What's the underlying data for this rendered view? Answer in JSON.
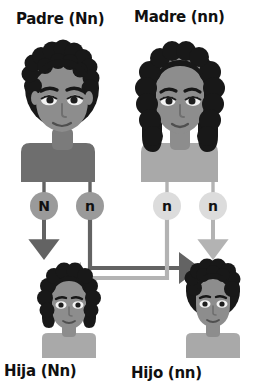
{
  "diagram": {
    "title_top_left": "Padre (Nn)",
    "title_top_right": "Madre (nn)",
    "title_bottom_left": "Hija (Nn)",
    "title_bottom_right": "Hijo (nn)"
  },
  "alleles": {
    "father_left": "N",
    "father_right": "n",
    "mother_left": "n",
    "mother_right": "n"
  },
  "colors": {
    "paternal_line": "#636363",
    "maternal_line": "#b3b3b3",
    "paternal_circle": "#9a9a9a",
    "maternal_circle": "#dcdcdc",
    "hair_dark": "#181818",
    "skin": "#8d8d8d",
    "shirt_dark": "#6e6e6e",
    "shirt_light": "#a9a9a9",
    "text": "#101010",
    "background": "#ffffff"
  },
  "figures": {
    "father": "father-portrait",
    "mother": "mother-portrait",
    "daughter": "daughter-portrait",
    "son": "son-portrait"
  }
}
